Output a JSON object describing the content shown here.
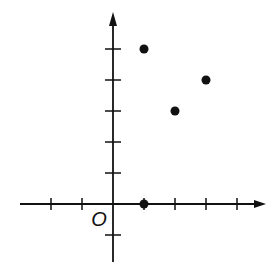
{
  "chart_data": {
    "type": "scatter",
    "title": "",
    "xlabel": "",
    "ylabel": "",
    "origin_label": "O",
    "xlim": [
      -3,
      4
    ],
    "ylim": [
      -1,
      6
    ],
    "x_ticks": [
      -2,
      -1,
      1,
      2,
      3,
      4
    ],
    "y_ticks": [
      -1,
      1,
      2,
      3,
      4,
      5
    ],
    "grid": false,
    "legend": null,
    "points": [
      {
        "x": 1,
        "y": 5
      },
      {
        "x": 2,
        "y": 3
      },
      {
        "x": 3,
        "y": 4
      },
      {
        "x": 1,
        "y": 0
      }
    ]
  },
  "colors": {
    "ink": "#111111",
    "background": "#ffffff"
  }
}
